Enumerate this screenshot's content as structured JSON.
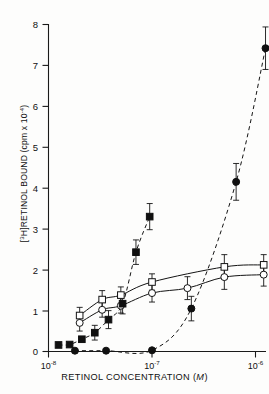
{
  "figure": {
    "background_color": "#fdfdfc",
    "ink_color": "#141414"
  },
  "axes": {
    "y_label_prefix": "[",
    "y_label_isotope": "3",
    "y_label_main": "H]RETINOL BOUND (cpm x 10",
    "y_label_exponent": "-4",
    "y_label_suffix": ")",
    "y_label_full": "[3H]RETINOL BOUND (cpm x 10-4)",
    "x_label": "RETINOL CONCENTRATION (M)",
    "x_label_text": "RETINOL CONCENTRATION (",
    "x_label_italic": "M",
    "x_label_close": ")"
  },
  "chart_data": {
    "type": "line",
    "title": "",
    "xlabel": "RETINOL CONCENTRATION (M)",
    "ylabel": "[3H]RETINOL BOUND (cpm x 10^-4)",
    "x_scale": "log",
    "xlim": [
      1e-08,
      1.8e-06
    ],
    "ylim": [
      0,
      8
    ],
    "grid": false,
    "legend_position": "none",
    "y_ticks": [
      0,
      1,
      2,
      3,
      4,
      5,
      6,
      7,
      8
    ],
    "y_tick_labels": [
      "0",
      "1",
      "2",
      "3",
      "4",
      "5",
      "6",
      "7",
      "8"
    ],
    "x_ticks": [
      1e-08,
      1e-07,
      1e-06
    ],
    "x_tick_labels": [
      "10-8",
      "10-7",
      "10-6"
    ],
    "x_tick_mantissa": [
      "10",
      "10",
      "10"
    ],
    "x_tick_exponents": [
      "-8",
      "-7",
      "-6"
    ],
    "series": [
      {
        "name": "open-squares",
        "marker": "open-square",
        "line_style": "solid",
        "points": [
          {
            "x": 2e-08,
            "y": 0.88,
            "err": 0.2
          },
          {
            "x": 3.3e-08,
            "y": 1.27,
            "err": 0.22
          },
          {
            "x": 5e-08,
            "y": 1.38,
            "err": 0.2
          },
          {
            "x": 1e-07,
            "y": 1.7,
            "err": 0.2
          },
          {
            "x": 5e-07,
            "y": 2.07,
            "err": 0.3
          },
          {
            "x": 1.2e-06,
            "y": 2.12,
            "err": 0.25
          }
        ]
      },
      {
        "name": "open-circles",
        "marker": "open-circle",
        "line_style": "solid",
        "points": [
          {
            "x": 2e-08,
            "y": 0.7,
            "err": 0.2
          },
          {
            "x": 3.3e-08,
            "y": 1.02,
            "err": 0.18
          },
          {
            "x": 5e-08,
            "y": 1.12,
            "err": 0.18
          },
          {
            "x": 1e-07,
            "y": 1.43,
            "err": 0.22
          },
          {
            "x": 2.2e-07,
            "y": 1.55,
            "err": 0.28
          },
          {
            "x": 5e-07,
            "y": 1.82,
            "err": 0.3
          },
          {
            "x": 1.2e-06,
            "y": 1.88,
            "err": 0.28
          }
        ]
      },
      {
        "name": "filled-squares",
        "marker": "filled-square",
        "line_style": "dashed",
        "points": [
          {
            "x": 1.25e-08,
            "y": 0.16,
            "err": 0.0
          },
          {
            "x": 1.6e-08,
            "y": 0.17,
            "err": 0.0
          },
          {
            "x": 2.1e-08,
            "y": 0.3,
            "err": 0.0
          },
          {
            "x": 2.8e-08,
            "y": 0.46,
            "err": 0.18
          },
          {
            "x": 3.8e-08,
            "y": 0.78,
            "err": 0.22
          },
          {
            "x": 5.2e-08,
            "y": 1.17,
            "err": 0.25
          },
          {
            "x": 7e-08,
            "y": 2.43,
            "err": 0.3
          },
          {
            "x": 9.5e-08,
            "y": 3.3,
            "err": 0.32
          }
        ]
      },
      {
        "name": "filled-circles",
        "marker": "filled-circle",
        "line_style": "dashed",
        "points": [
          {
            "x": 1.8e-08,
            "y": 0.02,
            "err": 0.0
          },
          {
            "x": 3.6e-08,
            "y": 0.02,
            "err": 0.0
          },
          {
            "x": 1e-07,
            "y": 0.03,
            "err": 0.0
          },
          {
            "x": 2.4e-07,
            "y": 1.05,
            "err": 0.3
          },
          {
            "x": 6.5e-07,
            "y": 4.15,
            "err": 0.45
          },
          {
            "x": 1.25e-06,
            "y": 7.42,
            "err": 0.52
          }
        ]
      }
    ]
  }
}
